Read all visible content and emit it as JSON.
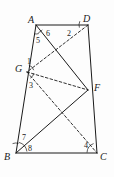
{
  "figure": {
    "type": "geometry-diagram",
    "background_color": "#fdfdfd",
    "stroke_color": "#1a1a1a",
    "canvas": {
      "width": 114,
      "height": 177
    },
    "vertices": [
      {
        "name": "A",
        "label": "A",
        "x": 36,
        "y": 25,
        "label_x": 28,
        "label_y": 15
      },
      {
        "name": "D",
        "label": "D",
        "x": 88,
        "y": 25,
        "label_x": 83,
        "label_y": 14
      },
      {
        "name": "B",
        "label": "B",
        "x": 16,
        "y": 153,
        "label_x": 4,
        "label_y": 152
      },
      {
        "name": "C",
        "label": "C",
        "x": 97,
        "y": 153,
        "label_x": 100,
        "label_y": 152
      },
      {
        "name": "G",
        "label": "G",
        "x": 27,
        "y": 72,
        "label_x": 15,
        "label_y": 64
      },
      {
        "name": "F",
        "label": "F",
        "x": 88,
        "y": 90,
        "label_x": 94,
        "label_y": 83
      }
    ],
    "solid_edges": [
      {
        "name": "side-AD",
        "from": "A",
        "to": "D"
      },
      {
        "name": "side-AB",
        "from": "A",
        "to": "B"
      },
      {
        "name": "side-BC",
        "from": "B",
        "to": "C"
      },
      {
        "name": "side-DC",
        "from": "D",
        "to": "C"
      },
      {
        "name": "segment-AF",
        "from": "A",
        "to": "F"
      },
      {
        "name": "segment-BF",
        "from": "B",
        "to": "F"
      }
    ],
    "dashed_edges": [
      {
        "name": "segment-DG",
        "from": "D",
        "to": "G"
      },
      {
        "name": "segment-GF",
        "from": "G",
        "to": "F"
      },
      {
        "name": "segment-GC",
        "from": "G",
        "to": "C"
      }
    ],
    "angle_labels": [
      {
        "name": "angle-1",
        "text": "1",
        "x": 27,
        "y": 58
      },
      {
        "name": "angle-2",
        "text": "2",
        "x": 67,
        "y": 30
      },
      {
        "name": "angle-3",
        "text": "3",
        "x": 29,
        "y": 82
      },
      {
        "name": "angle-4",
        "text": "4",
        "x": 84,
        "y": 142
      },
      {
        "name": "angle-5",
        "text": "5",
        "x": 36,
        "y": 37
      },
      {
        "name": "angle-6",
        "text": "6",
        "x": 46,
        "y": 30
      },
      {
        "name": "angle-7",
        "text": "7",
        "x": 22,
        "y": 134
      },
      {
        "name": "angle-8",
        "text": "8",
        "x": 28,
        "y": 145
      }
    ],
    "angle_arcs": [
      {
        "name": "arc-at-A-5",
        "cx": 36,
        "cy": 25,
        "r": 9,
        "start_deg": 72,
        "end_deg": 100
      },
      {
        "name": "arc-at-A-6",
        "cx": 36,
        "cy": 25,
        "r": 8,
        "start_deg": 38,
        "end_deg": 72
      },
      {
        "name": "arc-at-D-2",
        "cx": 88,
        "cy": 25,
        "r": 9,
        "start_deg": 163,
        "end_deg": 205
      },
      {
        "name": "arc-at-G-1",
        "cx": 27,
        "cy": 72,
        "r": 7,
        "start_deg": 285,
        "end_deg": 345
      },
      {
        "name": "arc-at-G-3",
        "cx": 27,
        "cy": 72,
        "r": 7,
        "start_deg": 10,
        "end_deg": 62
      },
      {
        "name": "arc-at-B-7",
        "cx": 16,
        "cy": 153,
        "r": 10,
        "start_deg": 250,
        "end_deg": 285
      },
      {
        "name": "arc-at-B-8",
        "cx": 16,
        "cy": 153,
        "r": 11,
        "start_deg": 285,
        "end_deg": 352
      },
      {
        "name": "arc-at-C-4",
        "cx": 97,
        "cy": 153,
        "r": 10,
        "start_deg": 182,
        "end_deg": 250
      }
    ]
  }
}
